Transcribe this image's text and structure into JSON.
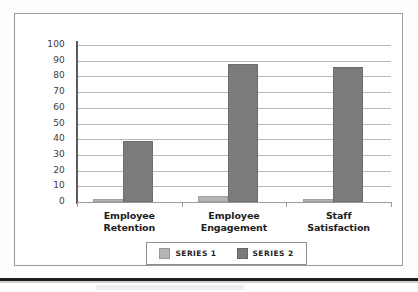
{
  "chart_data": {
    "type": "bar",
    "title": "",
    "subtitle": "",
    "xlabel": "",
    "ylabel": "",
    "ylim": [
      0,
      100
    ],
    "grid": true,
    "legend_position": "bottom",
    "categories": [
      "Employee Retention",
      "Employee Engagement",
      "Staff Satisfaction"
    ],
    "category_lines": [
      [
        "Employee",
        "Retention"
      ],
      [
        "Employee",
        "Engagement"
      ],
      [
        "Staff",
        "Satisfaction"
      ]
    ],
    "series": [
      {
        "name": "SERIES 1",
        "color": "#b4b4b2",
        "values": [
          2,
          4,
          2
        ]
      },
      {
        "name": "SERIES 2",
        "color": "#7b7b7b",
        "values": [
          39,
          88,
          86
        ]
      }
    ],
    "ytick_labels": [
      "100",
      "90",
      "80",
      "70",
      "60",
      "50",
      "40",
      "30",
      "20",
      "10",
      "0"
    ],
    "ytick_values": [
      100,
      90,
      80,
      70,
      60,
      50,
      40,
      30,
      20,
      10,
      0
    ]
  },
  "legend": {
    "entries": [
      {
        "label": "SERIES 1"
      },
      {
        "label": "SERIES 2"
      }
    ]
  },
  "colors": {
    "series1": "#b4b4b2",
    "series2": "#7b7b7b",
    "gridline": "#b9b9b9",
    "axis": "#5b5b5b",
    "frame": "#9a9a9a",
    "text": "#1d1d1d",
    "background": "#ffffff"
  }
}
